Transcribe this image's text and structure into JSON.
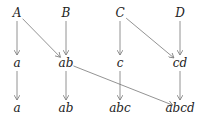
{
  "diagram": {
    "nodes": [
      {
        "id": "A",
        "label": "A",
        "x": 17,
        "y": 13
      },
      {
        "id": "B",
        "label": "B",
        "x": 66,
        "y": 13
      },
      {
        "id": "C",
        "label": "C",
        "x": 120,
        "y": 13
      },
      {
        "id": "D",
        "label": "D",
        "x": 180,
        "y": 13
      },
      {
        "id": "a1",
        "label": "a",
        "x": 17,
        "y": 63
      },
      {
        "id": "ab1",
        "label": "ab",
        "x": 66,
        "y": 63
      },
      {
        "id": "c1",
        "label": "c",
        "x": 120,
        "y": 63
      },
      {
        "id": "cd1",
        "label": "cd",
        "x": 180,
        "y": 63
      },
      {
        "id": "a2",
        "label": "a",
        "x": 17,
        "y": 108
      },
      {
        "id": "ab2",
        "label": "ab",
        "x": 66,
        "y": 108
      },
      {
        "id": "abc2",
        "label": "abc",
        "x": 120,
        "y": 108
      },
      {
        "id": "abcd2",
        "label": "abcd",
        "x": 180,
        "y": 108
      }
    ],
    "edges": [
      {
        "from": "A",
        "to": "a1"
      },
      {
        "from": "A",
        "to": "ab1"
      },
      {
        "from": "B",
        "to": "ab1"
      },
      {
        "from": "C",
        "to": "c1"
      },
      {
        "from": "C",
        "to": "cd1"
      },
      {
        "from": "D",
        "to": "cd1"
      },
      {
        "from": "a1",
        "to": "a2"
      },
      {
        "from": "ab1",
        "to": "ab2"
      },
      {
        "from": "ab1",
        "to": "abcd2"
      },
      {
        "from": "c1",
        "to": "abc2"
      },
      {
        "from": "cd1",
        "to": "abcd2"
      }
    ],
    "edge_color": "#777777"
  }
}
